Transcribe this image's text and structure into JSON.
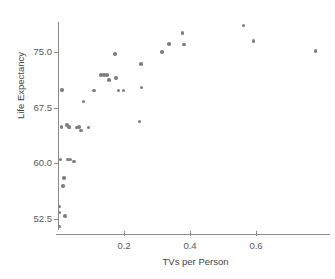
{
  "chart_data": {
    "type": "scatter",
    "title": "",
    "xlabel": "TVs per Person",
    "ylabel": "Life Expectancy",
    "xlim": [
      -0.01,
      0.825
    ],
    "ylim": [
      50.2,
      79.6
    ],
    "xticks": [
      0.2,
      0.4,
      0.6
    ],
    "xtick_labels": [
      "0.2",
      "0.4",
      "0.6"
    ],
    "yticks": [
      52.5,
      60.0,
      67.5,
      75.0
    ],
    "ytick_labels": [
      "52.5",
      "60.0",
      "67.5",
      "75.0"
    ],
    "grid": false,
    "legend": null,
    "marker": {
      "shape": "circle",
      "color": "#7f7f81",
      "size_px": 3.6
    },
    "axis_color": "#8a8a8c",
    "text_color": "#595959",
    "background": "#ffffff",
    "n_points": 39,
    "points": [
      {
        "x": 0.004,
        "y": 51.4
      },
      {
        "x": 0.004,
        "y": 53.3
      },
      {
        "x": 0.004,
        "y": 54.1
      },
      {
        "x": 0.021,
        "y": 52.8
      },
      {
        "x": 0.016,
        "y": 56.9
      },
      {
        "x": 0.018,
        "y": 58.0
      },
      {
        "x": 0.007,
        "y": 60.5
      },
      {
        "x": 0.03,
        "y": 60.5
      },
      {
        "x": 0.049,
        "y": 60.2
      },
      {
        "x": 0.012,
        "y": 69.9
      },
      {
        "x": 0.027,
        "y": 65.1
      },
      {
        "x": 0.033,
        "y": 64.9
      },
      {
        "x": 0.035,
        "y": 64.8
      },
      {
        "x": 0.057,
        "y": 64.8
      },
      {
        "x": 0.07,
        "y": 64.4
      },
      {
        "x": 0.092,
        "y": 64.8
      },
      {
        "x": 0.077,
        "y": 68.3
      },
      {
        "x": 0.109,
        "y": 69.8
      },
      {
        "x": 0.139,
        "y": 71.9
      },
      {
        "x": 0.148,
        "y": 71.9
      },
      {
        "x": 0.155,
        "y": 71.2
      },
      {
        "x": 0.172,
        "y": 74.7
      },
      {
        "x": 0.176,
        "y": 71.5
      },
      {
        "x": 0.183,
        "y": 69.8
      },
      {
        "x": 0.251,
        "y": 73.4
      },
      {
        "x": 0.253,
        "y": 70.2
      },
      {
        "x": 0.247,
        "y": 65.6
      },
      {
        "x": 0.316,
        "y": 75.0
      },
      {
        "x": 0.336,
        "y": 76.1
      },
      {
        "x": 0.377,
        "y": 77.6
      },
      {
        "x": 0.381,
        "y": 76.0
      },
      {
        "x": 0.562,
        "y": 78.6
      },
      {
        "x": 0.592,
        "y": 76.5
      },
      {
        "x": 0.78,
        "y": 75.1
      },
      {
        "x": 0.011,
        "y": 64.9
      },
      {
        "x": 0.063,
        "y": 64.9
      },
      {
        "x": 0.131,
        "y": 71.9
      },
      {
        "x": 0.199,
        "y": 69.8
      },
      {
        "x": 0.038,
        "y": 60.5
      }
    ]
  }
}
